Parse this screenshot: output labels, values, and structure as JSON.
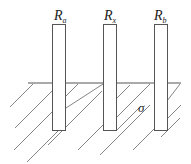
{
  "diagram": {
    "electrodes": [
      {
        "label": "R",
        "subscript": "a"
      },
      {
        "label": "R",
        "subscript": "x"
      },
      {
        "label": "R",
        "subscript": "b"
      }
    ],
    "medium_label": "σ",
    "colors": {
      "stroke": "#555555",
      "text": "#222222",
      "background": "#ffffff"
    }
  }
}
